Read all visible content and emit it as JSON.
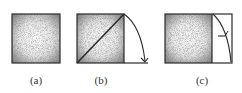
{
  "figure": {
    "panels": [
      {
        "id": "a",
        "label": "(a)",
        "description": "shaded square"
      },
      {
        "id": "b",
        "label": "(b)",
        "description": "shaded square with diagonal; arc with arrow rotating from top-right corner down to baseline extension"
      },
      {
        "id": "c",
        "label": "(c)",
        "description": "shaded square with attached unshaded rectangle on right; arc with tick mark inside rectangle"
      }
    ]
  },
  "colors": {
    "stroke": "#2a2a2a",
    "shade_dark": "#6e6e6e",
    "shade_light": "#f4f4f4",
    "background": "#ffffff"
  }
}
